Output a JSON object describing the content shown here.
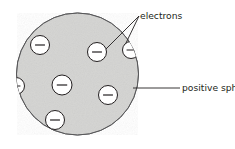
{
  "figure": {
    "name": "plum-pudding-atomic-model-diagram",
    "background_color": "#ffffff",
    "width": 235,
    "height": 149
  },
  "sphere": {
    "name": "positive-sphere",
    "center_x": 77.5,
    "center_y": 74,
    "radius": 61,
    "fill_color": "#d4d4d2",
    "stroke_color": "#58585a",
    "stroke_width": 1.0
  },
  "electrons": {
    "symbol": "−",
    "fill_color": "#ffffff",
    "stroke_color": "#231f20",
    "radius": 9.5,
    "items": [
      {
        "name": "electron-upper-left",
        "cx": 40,
        "cy": 45,
        "r": 9.5,
        "clipped": false
      },
      {
        "name": "electron-upper-right",
        "cx": 97,
        "cy": 52,
        "r": 9.5,
        "clipped": false
      },
      {
        "name": "electron-center",
        "cx": 62,
        "cy": 85,
        "r": 10,
        "clipped": false
      },
      {
        "name": "electron-lower-right",
        "cx": 108,
        "cy": 95,
        "r": 9.5,
        "clipped": false
      },
      {
        "name": "electron-bottom",
        "cx": 55,
        "cy": 120,
        "r": 9.5,
        "clipped": false
      },
      {
        "name": "electron-edge-right",
        "cx": 131,
        "cy": 50,
        "r": 8.5,
        "clipped": true
      },
      {
        "name": "electron-edge-left",
        "cx": 16,
        "cy": 86,
        "r": 8.5,
        "clipped": true
      }
    ]
  },
  "labels": [
    {
      "name": "electrons-label",
      "text": "electrons",
      "x": 140,
      "y": 19,
      "anchor": "start"
    },
    {
      "name": "positive-sphere-label",
      "text": "positive sphere",
      "x": 182,
      "y": 91,
      "anchor": "start"
    }
  ],
  "leader_lines": [
    {
      "name": "leader-electrons-to-upper-right-electron",
      "color": "#231f20",
      "width": 0.9,
      "points": "139,16 106,49"
    },
    {
      "name": "leader-electrons-to-edge-electron",
      "color": "#231f20",
      "width": 0.9,
      "points": "139,16 126,43"
    },
    {
      "name": "leader-positive-sphere",
      "color": "#231f20",
      "width": 0.9,
      "points": "133,88 180,88"
    }
  ]
}
